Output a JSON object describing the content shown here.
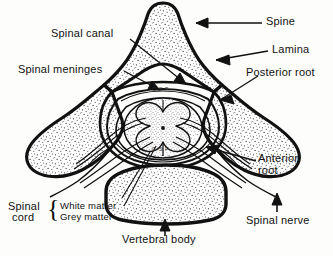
{
  "figure": {
    "ink_color": "#111111",
    "background_color": "#fdfdfb"
  },
  "labels": {
    "spine": "Spine",
    "lamina": "Lamina",
    "posterior_root": "Posterior root",
    "spinal_canal": "Spinal canal",
    "spinal_meninges": "Spinal meninges",
    "anterior_root_line1": "Anterior",
    "anterior_root_line2": "root",
    "spinal_nerve": "Spinal nerve",
    "vertebral_body": "Vertebral body",
    "spinal_cord_line1": "Spinal",
    "spinal_cord_line2": "cord",
    "white_matter": "White matter",
    "grey_matter": "Grey matter",
    "brace_glyph": "{",
    "csf_upper": "C.S.F.",
    "csf_lower": "C.S.F."
  },
  "structures": [
    {
      "name": "spinous-process",
      "label": "Spine"
    },
    {
      "name": "lamina",
      "label": "Lamina"
    },
    {
      "name": "transverse-process-left",
      "label": "Transverse process"
    },
    {
      "name": "transverse-process-right",
      "label": "Transverse process"
    },
    {
      "name": "vertebral-body",
      "label": "Vertebral body"
    },
    {
      "name": "spinal-canal",
      "label": "Spinal canal"
    },
    {
      "name": "spinal-meninges",
      "label": "Spinal meninges"
    },
    {
      "name": "white-matter",
      "label": "White matter"
    },
    {
      "name": "grey-matter",
      "label": "Grey matter"
    },
    {
      "name": "posterior-root",
      "label": "Posterior root"
    },
    {
      "name": "anterior-root",
      "label": "Anterior root"
    },
    {
      "name": "spinal-nerve",
      "label": "Spinal nerve"
    },
    {
      "name": "cerebrospinal-fluid",
      "label": "C.S.F."
    }
  ]
}
